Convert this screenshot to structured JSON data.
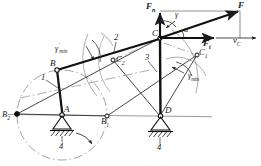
{
  "diagram": {
    "type": "kinematic-mechanism-schematic",
    "background": "#ffffff",
    "ink": "#1a1a1a",
    "accent_gray": "#8a8a8a"
  },
  "labels": {
    "force_resultant": "F",
    "force_normal": "F",
    "force_normal_sub": "n",
    "force_tangential": "F",
    "force_tangential_sub": "t",
    "velocity_c": "v",
    "velocity_c_sub": "C",
    "angle_gamma": "γ",
    "angle_alpha": "α",
    "gamma_min": "γ",
    "gamma_min_sub": "min",
    "gamma_min_prime": "γ",
    "gamma_min_prime_sup": "′",
    "gamma_min_prime_sub": "min",
    "point_A": "A",
    "point_B": "B",
    "point_C": "C",
    "point_D": "D",
    "point_B1": "B",
    "point_B1_sub": "1",
    "point_B2": "B",
    "point_B2_sub": "2",
    "point_C1": "C",
    "point_C1_sub": "1",
    "point_C2": "C",
    "point_C2_sub": "2",
    "link_1": "1",
    "link_2": "2",
    "link_3": "3",
    "link_4_left": "4",
    "link_4_right": "4"
  },
  "geometry": {
    "pivot_A": [
      62,
      115
    ],
    "pivot_D": [
      160,
      116
    ],
    "point_B": [
      57,
      70
    ],
    "point_C": [
      160,
      38
    ],
    "point_B1": [
      107,
      116
    ],
    "point_B2": [
      17,
      114
    ],
    "point_C1": [
      197,
      55
    ],
    "point_C2": [
      113,
      60
    ],
    "crank_circle_center": [
      62,
      115
    ],
    "crank_circle_radius": 45,
    "force_origin": [
      160,
      38
    ],
    "force_tip": [
      240,
      10
    ],
    "force_normal_tip": [
      160,
      12
    ],
    "force_tangential_tip": [
      240,
      38
    ]
  }
}
